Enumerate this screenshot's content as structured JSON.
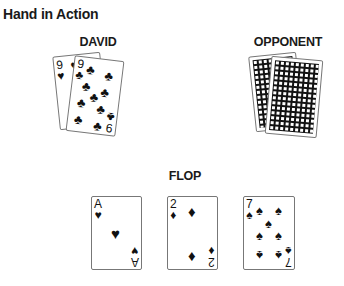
{
  "title": "Hand in Action",
  "players": [
    {
      "label": "DAVID",
      "cards": [
        {
          "rank": "9",
          "suit": "♥",
          "suit_name": "hearts"
        },
        {
          "rank": "9",
          "suit": "♣",
          "suit_name": "clubs"
        }
      ]
    },
    {
      "label": "OPPONENT",
      "cards": [
        {
          "face": "down"
        },
        {
          "face": "down"
        }
      ]
    }
  ],
  "board": {
    "label": "FLOP",
    "cards": [
      {
        "rank": "A",
        "suit": "♥",
        "suit_name": "hearts"
      },
      {
        "rank": "2",
        "suit": "♦",
        "suit_name": "diamonds"
      },
      {
        "rank": "7",
        "suit": "♠",
        "suit_name": "spades"
      }
    ]
  }
}
